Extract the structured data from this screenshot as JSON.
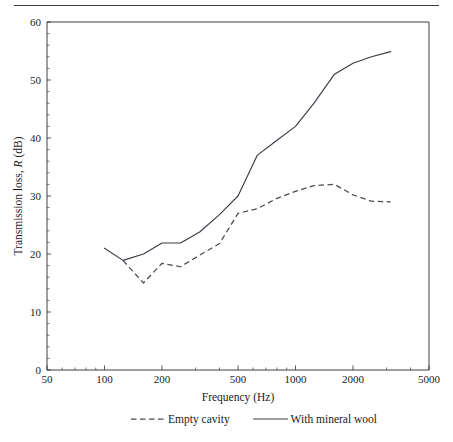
{
  "figure": {
    "top_rule": "horizontal-rule"
  },
  "chart_data": {
    "type": "line",
    "title": "",
    "xlabel": "Frequency (Hz)",
    "ylabel_prefix": "Transmission loss, ",
    "ylabel_symbol": "R",
    "ylabel_suffix": " (dB)",
    "ylabel": "Transmission loss, R (dB)",
    "xscale": "log",
    "xlim": [
      50,
      5000
    ],
    "ylim": [
      0,
      60
    ],
    "grid": false,
    "legend_position": "below-axes",
    "xticks": [
      50,
      100,
      200,
      500,
      1000,
      2000,
      5000
    ],
    "xticklabels": [
      "50",
      "100",
      "200",
      "500",
      "1000",
      "2000",
      "5000"
    ],
    "yticks": [
      0,
      10,
      20,
      30,
      40,
      50,
      60
    ],
    "yticklabels": [
      "0",
      "10",
      "20",
      "30",
      "40",
      "50",
      "60"
    ],
    "y_minor_step": 2,
    "x": [
      100,
      125,
      160,
      200,
      250,
      315,
      400,
      500,
      630,
      800,
      1000,
      1250,
      1600,
      2000,
      2500,
      3150
    ],
    "series": [
      {
        "name": "Empty cavity",
        "style": "dashed",
        "values": [
          null,
          18.9,
          15.0,
          18.4,
          17.8,
          19.8,
          21.8,
          27.0,
          27.8,
          29.6,
          30.8,
          31.8,
          32.0,
          30.2,
          29.1,
          29.0
        ]
      },
      {
        "name": "With mineral wool",
        "style": "solid",
        "values": [
          21.0,
          18.9,
          20.0,
          21.9,
          21.9,
          23.8,
          26.8,
          30.0,
          37.0,
          39.6,
          42.0,
          46.0,
          51.0,
          52.9,
          54.0,
          54.9
        ]
      }
    ],
    "legend": [
      {
        "label": "Empty cavity",
        "style": "dashed"
      },
      {
        "label": "With mineral wool",
        "style": "solid"
      }
    ]
  }
}
